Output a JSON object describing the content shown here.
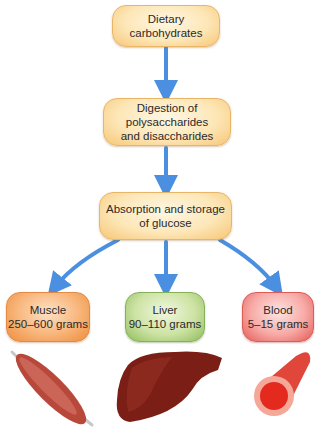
{
  "diagram": {
    "nodes": [
      {
        "id": "dietary",
        "lines": [
          "Dietary carbohydrates"
        ],
        "color": "#fde7b8"
      },
      {
        "id": "digestion",
        "lines": [
          "Digestion of polysaccharides",
          "and disaccharides"
        ],
        "color": "#fde7b8"
      },
      {
        "id": "absorption",
        "lines": [
          "Absorption and storage",
          "of glucose"
        ],
        "color": "#fde7b8"
      },
      {
        "id": "muscle",
        "lines": [
          "Muscle",
          "250–600 grams"
        ],
        "color": "#f8b57a"
      },
      {
        "id": "liver",
        "lines": [
          "Liver",
          "90–110 grams"
        ],
        "color": "#cde3a4"
      },
      {
        "id": "blood",
        "lines": [
          "Blood",
          "5–15 grams"
        ],
        "color": "#f7aaa6"
      }
    ],
    "edges": [
      {
        "from": "dietary",
        "to": "digestion"
      },
      {
        "from": "digestion",
        "to": "absorption"
      },
      {
        "from": "absorption",
        "to": "muscle"
      },
      {
        "from": "absorption",
        "to": "liver"
      },
      {
        "from": "absorption",
        "to": "blood"
      }
    ],
    "arrow_color": "#4a8fe0",
    "illustrations": [
      "muscle-illustration",
      "liver-illustration",
      "blood-vessel-illustration"
    ]
  }
}
